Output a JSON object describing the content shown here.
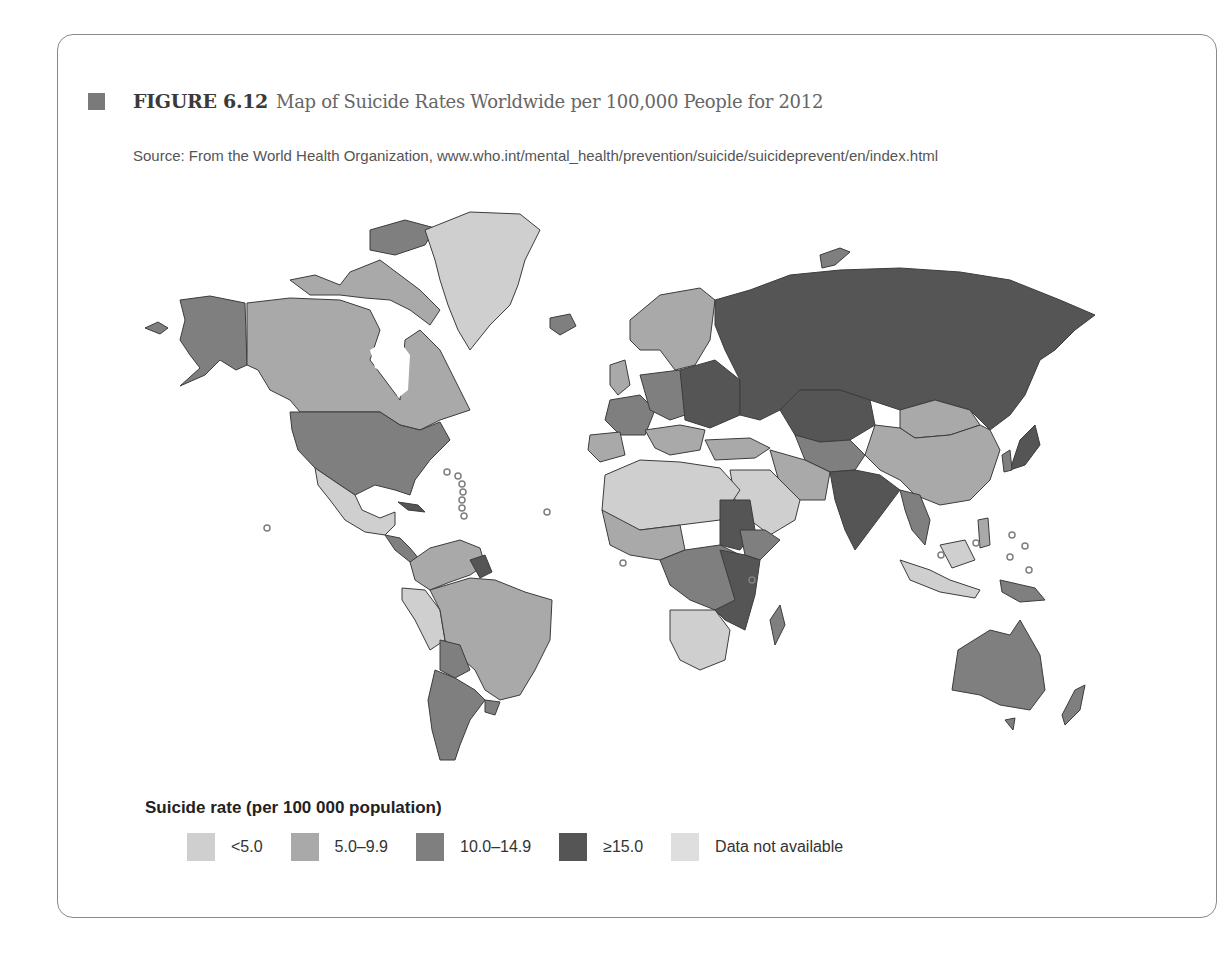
{
  "figure": {
    "number": "FIGURE 6.12",
    "title": "Map of Suicide Rates Worldwide per 100,000 People for 2012",
    "source": "Source: From the World Health Organization, www.who.int/mental_health/prevention/suicide/suicideprevent/en/index.html"
  },
  "legend": {
    "title": "Suicide rate (per 100 000 population)",
    "items": [
      {
        "label": "<5.0",
        "color": "#cfcfcf"
      },
      {
        "label": "5.0–9.9",
        "color": "#a9a9a9"
      },
      {
        "label": "10.0–14.9",
        "color": "#7f7f7f"
      },
      {
        "label": "≥15.0",
        "color": "#555555"
      },
      {
        "label": "Data not available",
        "color": "#dedede"
      }
    ]
  },
  "colors": {
    "lt5": "#cfcfcf",
    "r5_10": "#a9a9a9",
    "r10_15": "#7f7f7f",
    "ge15": "#555555",
    "na": "#e2e2e2",
    "border": "#3c3c3c"
  },
  "regions": [
    {
      "name": "Greenland",
      "category": "<5.0"
    },
    {
      "name": "Canada",
      "category": "5.0–9.9"
    },
    {
      "name": "United States",
      "category": "10.0–14.9"
    },
    {
      "name": "Mexico",
      "category": "<5.0"
    },
    {
      "name": "Brazil",
      "category": "5.0–9.9"
    },
    {
      "name": "Argentina",
      "category": "10.0–14.9"
    },
    {
      "name": "Russia",
      "category": "≥15.0"
    },
    {
      "name": "Kazakhstan",
      "category": "≥15.0"
    },
    {
      "name": "China",
      "category": "5.0–9.9"
    },
    {
      "name": "Mongolia",
      "category": "5.0–9.9"
    },
    {
      "name": "India",
      "category": "≥15.0"
    },
    {
      "name": "Australia",
      "category": "10.0–14.9"
    },
    {
      "name": "North Africa",
      "category": "<5.0"
    },
    {
      "name": "Southern Africa",
      "category": "<5.0"
    },
    {
      "name": "Central/East Africa",
      "category": "≥15.0"
    },
    {
      "name": "Western Europe",
      "category": "10.0–14.9"
    },
    {
      "name": "Middle East",
      "category": "<5.0"
    }
  ]
}
